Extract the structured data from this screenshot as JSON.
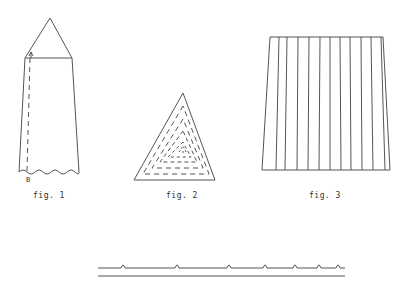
{
  "figures": [
    {
      "id": "fig1",
      "caption": "fig. 1",
      "point_labels": [
        "A",
        "B"
      ],
      "description": "pencil-shaped obelisk with triangular top, dashed vertical line A to B, wavy bottom edge"
    },
    {
      "id": "fig2",
      "caption": "fig. 2",
      "description": "triangle with concentric dashed inner triangles spiraling inward"
    },
    {
      "id": "fig3",
      "caption": "fig. 3",
      "description": "trapezoid divided by vertical lines into strips"
    }
  ],
  "bottom_strip": {
    "description": "two parallel horizontal lines, upper with small arch bumps",
    "bump_count": 7
  },
  "colors": {
    "stroke": "#555555",
    "background": "#ffffff"
  }
}
